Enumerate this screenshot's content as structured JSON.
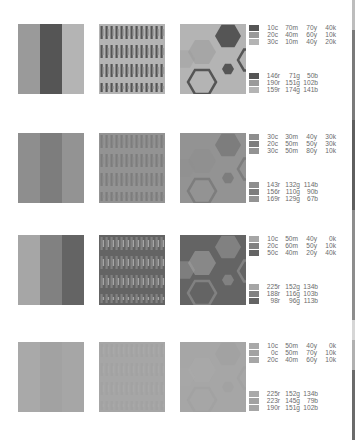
{
  "page": {
    "type": "scanned color palette page",
    "background": "#ffffff"
  },
  "rows": [
    {
      "swatch_tones": [
        "#9a9a9a",
        "#555555",
        "#b4b4b4"
      ],
      "cmyk": [
        {
          "c": "10c",
          "m": "70m",
          "y": "70y",
          "k": "40k",
          "chip": "#555555"
        },
        {
          "c": "20c",
          "m": "40m",
          "y": "60y",
          "k": "10k",
          "chip": "#9a9a9a"
        },
        {
          "c": "30c",
          "m": "10m",
          "y": "40y",
          "k": "20k",
          "chip": "#b4b4b4"
        }
      ],
      "rgb": [
        {
          "r": "146r",
          "g": "71g",
          "b": "50b",
          "chip": "#555555"
        },
        {
          "r": "190r",
          "g": "151g",
          "b": "102b",
          "chip": "#9a9a9a"
        },
        {
          "r": "159r",
          "g": "174g",
          "b": "141b",
          "chip": "#b4b4b4"
        }
      ]
    },
    {
      "swatch_tones": [
        "#8e8e8e",
        "#7d7d7d",
        "#939393"
      ],
      "cmyk": [
        {
          "c": "30c",
          "m": "30m",
          "y": "40y",
          "k": "30k",
          "chip": "#8e8e8e"
        },
        {
          "c": "20c",
          "m": "50m",
          "y": "50y",
          "k": "30k",
          "chip": "#7d7d7d"
        },
        {
          "c": "30c",
          "m": "50m",
          "y": "80y",
          "k": "10k",
          "chip": "#939393"
        }
      ],
      "rgb": [
        {
          "r": "143r",
          "g": "132g",
          "b": "114b",
          "chip": "#8e8e8e"
        },
        {
          "r": "156r",
          "g": "110g",
          "b": "90b",
          "chip": "#7d7d7d"
        },
        {
          "r": "169r",
          "g": "129g",
          "b": "67b",
          "chip": "#939393"
        }
      ]
    },
    {
      "swatch_tones": [
        "#a6a6a6",
        "#818181",
        "#646464"
      ],
      "cmyk": [
        {
          "c": "10c",
          "m": "50m",
          "y": "40y",
          "k": "0k",
          "chip": "#a6a6a6"
        },
        {
          "c": "20c",
          "m": "60m",
          "y": "50y",
          "k": "10k",
          "chip": "#818181"
        },
        {
          "c": "50c",
          "m": "40m",
          "y": "20y",
          "k": "40k",
          "chip": "#646464"
        }
      ],
      "rgb": [
        {
          "r": "225r",
          "g": "152g",
          "b": "134b",
          "chip": "#a6a6a6"
        },
        {
          "r": "188r",
          "g": "116g",
          "b": "103b",
          "chip": "#818181"
        },
        {
          "r": "98r",
          "g": "96g",
          "b": "113b",
          "chip": "#646464"
        }
      ]
    },
    {
      "swatch_tones": [
        "#a9a9a9",
        "#a2a2a2",
        "#a6a6a6"
      ],
      "cmyk": [
        {
          "c": "10c",
          "m": "50m",
          "y": "40y",
          "k": "0k",
          "chip": "#a9a9a9"
        },
        {
          "c": "0c",
          "m": "50m",
          "y": "70y",
          "k": "10k",
          "chip": "#a2a2a2"
        },
        {
          "c": "20c",
          "m": "40m",
          "y": "60y",
          "k": "10k",
          "chip": "#a6a6a6"
        }
      ],
      "rgb": [
        {
          "r": "225r",
          "g": "152g",
          "b": "134b",
          "chip": "#a9a9a9"
        },
        {
          "r": "223r",
          "g": "145g",
          "b": "79b",
          "chip": "#a2a2a2"
        },
        {
          "r": "190r",
          "g": "151g",
          "b": "102b",
          "chip": "#a6a6a6"
        }
      ]
    }
  ],
  "edge_strip": {
    "segments": [
      {
        "top": 0,
        "height": 30,
        "color": "#bdbdbd"
      },
      {
        "top": 30,
        "height": 90,
        "color": "#7a7a7a"
      },
      {
        "top": 120,
        "height": 90,
        "color": "#5f5f5f"
      },
      {
        "top": 210,
        "height": 110,
        "color": "#8d8d8d"
      },
      {
        "top": 320,
        "height": 20,
        "color": "#d6d6d6"
      },
      {
        "top": 340,
        "height": 30,
        "color": "#b0b0b0"
      },
      {
        "top": 370,
        "height": 70,
        "color": "#6b6b6b"
      }
    ]
  }
}
